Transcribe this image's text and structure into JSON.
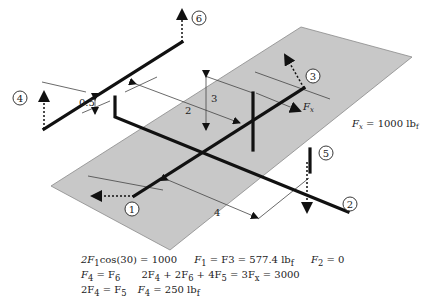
{
  "diagram": {
    "plane_color": "#c8c8c8",
    "line_color": "#111111",
    "nodes": [
      {
        "id": "1",
        "label": "1"
      },
      {
        "id": "2",
        "label": "2"
      },
      {
        "id": "3",
        "label": "3"
      },
      {
        "id": "4",
        "label": "4"
      },
      {
        "id": "5",
        "label": "5"
      },
      {
        "id": "6",
        "label": "6"
      }
    ],
    "dimensions": {
      "d_0_5": "0.5",
      "d_2": "2",
      "d_3": "3",
      "d_4": "4"
    },
    "force_label": "F",
    "force_sub": "x",
    "force_value": {
      "lhs": "F",
      "sub": "x",
      "rhs": " = 1000 lb",
      "unit_sub": "f"
    }
  },
  "equations": {
    "line1": {
      "a": "2F",
      "a_sub": "1",
      "a_rest": "cos(30) = 1000",
      "b": "F",
      "b_sub": "1",
      "b_rest": " = F3 = 577.4 lb",
      "b_unit_sub": "f",
      "c": "F",
      "c_sub": "2",
      "c_rest": " = 0"
    },
    "line2": {
      "a": "F",
      "a_sub": "4",
      "a_mid": " = F",
      "a_sub2": "6",
      "b": "2F",
      "b_sub": "4",
      "b_mid1": " + 2F",
      "b_sub2": "6",
      "b_mid2": " + 4F",
      "b_sub3": "5",
      "b_mid3": " = 3F",
      "b_sub4": "x",
      "b_rest": " = 3000"
    },
    "line3": {
      "a": "2F",
      "a_sub": "4",
      "a_mid": " = F",
      "a_sub2": "5",
      "b": "F",
      "b_sub": "4",
      "b_rest": " = 250 lb",
      "b_unit_sub": "f"
    }
  }
}
